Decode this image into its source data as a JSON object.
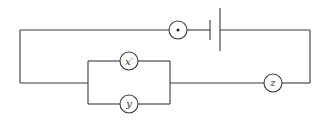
{
  "diagram": {
    "type": "circuit",
    "colors": {
      "line": "#3a3a3a",
      "background": "#ffffff",
      "text": "#333333"
    },
    "components": [
      {
        "id": "meter-dot",
        "kind": "circle-element",
        "label": "•"
      },
      {
        "id": "battery",
        "kind": "cell",
        "label": ""
      },
      {
        "id": "x-prime",
        "kind": "circle-element",
        "label": "x′"
      },
      {
        "id": "y",
        "kind": "circle-element",
        "label": "y"
      },
      {
        "id": "z",
        "kind": "circle-element",
        "label": "z"
      }
    ],
    "labels": {
      "x_prime": "x′",
      "y": "y",
      "z": "z"
    },
    "topology": "x′ and y in parallel, in series with z, battery, and dot element"
  }
}
